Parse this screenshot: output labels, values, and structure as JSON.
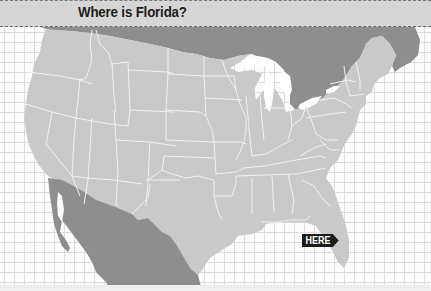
{
  "title": "Where is Florida?",
  "marker": {
    "label": "HERE",
    "points_to": "Florida"
  },
  "map": {
    "region": "Contiguous United States with state borders",
    "neighbors": [
      "Canada",
      "Mexico"
    ],
    "colors": {
      "us_states": "#c9c9c9",
      "neighbors": "#8e8e8e",
      "borders": "#f2f2f2",
      "water": "#ffffff",
      "grid_lines": "#dcdcdc",
      "title_bar": "#d6d6d6",
      "marker_bg": "#1c1c1c"
    }
  }
}
